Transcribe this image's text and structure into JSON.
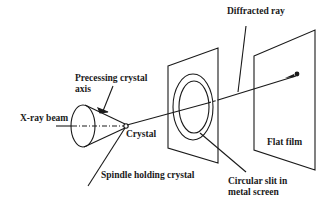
{
  "diagram": {
    "labels": {
      "diffracted_ray": "Diffracted ray",
      "precessing_axis_line1": "Precessing crystal",
      "precessing_axis_line2": "axis",
      "xray_beam": "X-ray beam",
      "crystal": "Crystal",
      "spindle": "Spindle holding crystal",
      "circular_slit_line1": "Circular slit in",
      "circular_slit_line2": "metal screen",
      "flat_film": "Flat film"
    },
    "colors": {
      "stroke": "#1a1a1a",
      "background": "#ffffff"
    }
  }
}
